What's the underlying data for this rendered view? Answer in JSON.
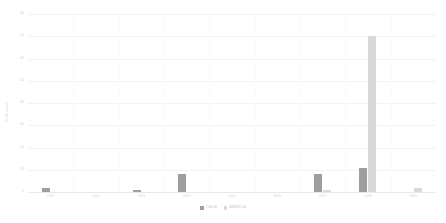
{
  "chart_data": {
    "type": "bar",
    "title": "",
    "subtitle": "",
    "xlabel": "",
    "ylabel": "Nº de casos",
    "ylim": [
      0,
      80
    ],
    "yticks": [
      0,
      10,
      20,
      30,
      40,
      50,
      60,
      70,
      80
    ],
    "ytick_labels": [
      "0",
      "10",
      "20",
      "30",
      "40",
      "50",
      "60",
      "70",
      "80"
    ],
    "grid": true,
    "legend_position": "bottom-center",
    "categories": [
      "2011",
      "2012",
      "2013",
      "2014",
      "2015",
      "2016",
      "2017",
      "2018",
      "2019"
    ],
    "series": [
      {
        "name": "ITÁLIA",
        "color": "#9e9e9e",
        "values": [
          2,
          0,
          1,
          8,
          0,
          0,
          8,
          11,
          0
        ]
      },
      {
        "name": "AMÉRICA",
        "color": "#d9d9d9",
        "values": [
          0,
          0,
          0,
          0,
          0,
          0,
          1,
          70,
          2
        ]
      }
    ]
  },
  "legend": {
    "items": [
      {
        "label": "ITÁLIA",
        "color": "#9e9e9e"
      },
      {
        "label": "AMÉRICA",
        "color": "#d9d9d9"
      }
    ]
  },
  "colors": {
    "series_0": "#9e9e9e",
    "series_1": "#d9d9d9",
    "gridline": "#f2f2f2",
    "axis": "#e8e8e8",
    "tick_text": "#d2d2d2",
    "background": "#ffffff"
  }
}
